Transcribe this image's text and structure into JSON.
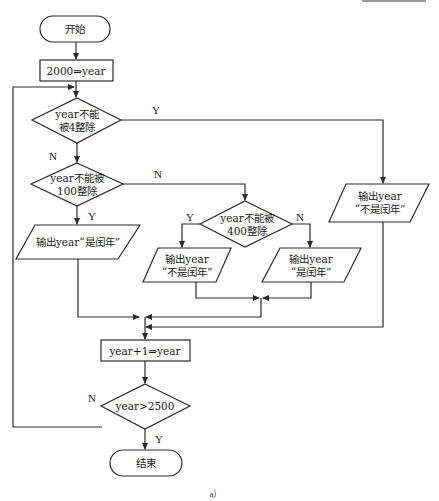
{
  "flowchart": {
    "start": "开始",
    "init": "2000⇒year",
    "cond_div4": [
      "year不能",
      "被4整除"
    ],
    "cond_div100": [
      "year不能被",
      "100整除"
    ],
    "cond_div400": [
      "year不能被",
      "400整除"
    ],
    "out_leap_left": "输出year“是闰年”",
    "out_not_leap_mid": [
      "输出year",
      "“不是闰年”"
    ],
    "out_leap_right": [
      "输出year",
      "“是闰年”"
    ],
    "out_not_leap_far": [
      "输出year",
      "“不是闰年”"
    ],
    "increment": "year+1⇒year",
    "cond_end": "year>2500",
    "end": "结束",
    "labels": {
      "div4_yes": "Y",
      "div4_no": "N",
      "div100_no": "N",
      "div100_yes": "Y",
      "div400_yes": "Y",
      "div400_no": "N",
      "end_no": "N",
      "end_yes": "Y"
    }
  },
  "caption": "a）"
}
